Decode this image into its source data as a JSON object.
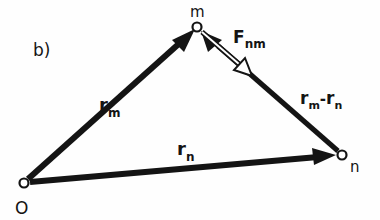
{
  "diagram": {
    "panel_label": "b)",
    "points": {
      "origin": {
        "label": "O",
        "x": 24,
        "y": 183
      },
      "m": {
        "label": "m",
        "x": 197,
        "y": 27
      },
      "n": {
        "label": "n",
        "x": 342,
        "y": 155
      }
    },
    "vectors": {
      "r_m": {
        "base": "r",
        "sub": "m",
        "from": "O",
        "to": "m"
      },
      "r_n": {
        "base": "r",
        "sub": "n",
        "from": "O",
        "to": "n"
      },
      "r_m_minus_r_n": {
        "base1": "r",
        "sub1": "m",
        "op": "-",
        "base2": "r",
        "sub2": "n",
        "from": "n",
        "to": "m"
      },
      "F_nm": {
        "base": "F",
        "sub": "nm",
        "from": "m",
        "toward": "n",
        "style": "hollow"
      }
    },
    "colors": {
      "ink": "#141414",
      "background": "#fefefe"
    }
  }
}
